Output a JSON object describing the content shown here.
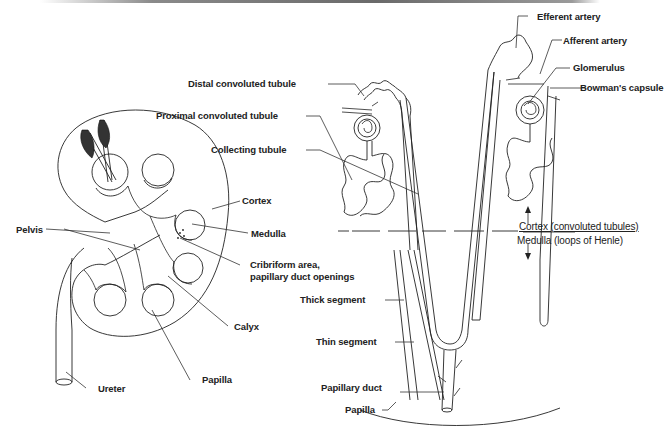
{
  "figure": {
    "kidney": {
      "labels": {
        "pelvis": "Pelvis",
        "cortex": "Cortex",
        "medulla": "Medulla",
        "cribriform_line1": "Cribriform area,",
        "cribriform_line2": "papillary duct openings",
        "calyx": "Calyx",
        "papilla": "Papilla",
        "ureter": "Ureter"
      }
    },
    "nephron": {
      "labels": {
        "efferent_artery": "Efferent artery",
        "afferent_artery": "Afferent artery",
        "glomerulus": "Glomerulus",
        "bowmans_capsule": "Bowman's capsule",
        "distal_convoluted_tubule": "Distal convoluted tubule",
        "proximal_convoluted_tubule": "Proximal convoluted tubule",
        "collecting_tubule": "Collecting tubule",
        "cortex_region": "Cortex (convoluted tubules)",
        "medulla_region": "Medulla (loops of Henle)",
        "thick_segment": "Thick segment",
        "thin_segment": "Thin segment",
        "papillary_duct": "Papillary duct",
        "papilla": "Papilla"
      }
    }
  }
}
